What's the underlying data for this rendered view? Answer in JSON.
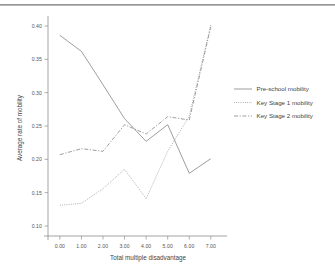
{
  "figure": {
    "rule_present": true,
    "background_color": "#ffffff",
    "line_color": "#8d8d8d",
    "text_color": "#4a4a4a"
  },
  "chart_data": {
    "type": "line",
    "title": "",
    "xlabel": "Total multiple disadvantage",
    "ylabel": "Average rate of mobility",
    "x": [
      0,
      1,
      2,
      3,
      4,
      5,
      6,
      7
    ],
    "xtick_labels": [
      "0.00",
      "1.00",
      "2.00",
      "3.00",
      "4.00",
      "5.00",
      "6.00",
      "7.00"
    ],
    "ytick_labels": [
      "0.10",
      "0.15",
      "0.20",
      "0.25",
      "0.30",
      "0.35",
      "0.40"
    ],
    "ytick_values": [
      0.1,
      0.15,
      0.2,
      0.25,
      0.3,
      0.35,
      0.4
    ],
    "xlim": [
      -0.55,
      7.75
    ],
    "ylim": [
      0.085,
      0.415
    ],
    "grid": false,
    "legend_position": "right",
    "series": [
      {
        "name": "Pre-school mobility",
        "style": "solid",
        "values": [
          0.386,
          0.362,
          0.312,
          0.261,
          0.227,
          0.252,
          0.179,
          0.201
        ]
      },
      {
        "name": "Key Stage 1 mobility",
        "style": "dotted",
        "values": [
          0.131,
          0.134,
          0.156,
          0.185,
          0.141,
          0.212,
          0.265,
          0.402
        ]
      },
      {
        "name": "Key Stage 2 mobility",
        "style": "dashed",
        "values": [
          0.207,
          0.216,
          0.212,
          0.252,
          0.238,
          0.264,
          0.259,
          0.399
        ]
      }
    ]
  },
  "legend": {
    "items": [
      {
        "label": "Pre-school mobility",
        "style": "solid"
      },
      {
        "label": "Key Stage 1 mobility",
        "style": "dotted"
      },
      {
        "label": "Key Stage 2 mobility",
        "style": "dashed"
      }
    ]
  },
  "caption_partial": ""
}
